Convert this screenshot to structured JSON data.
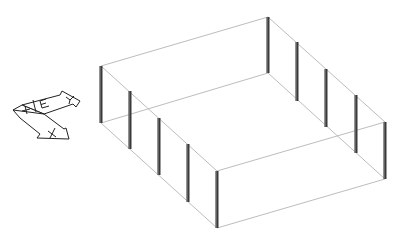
{
  "diagram": {
    "type": "isometric-wireframe",
    "colors": {
      "background": "#ffffff",
      "rails": "#bdbdbd",
      "posts": "#3a3a3a",
      "ucs_icon": "#222222"
    },
    "posts": [
      {
        "x": 101,
        "top": 66,
        "bottom": 123
      },
      {
        "x": 130,
        "top": 91,
        "bottom": 149
      },
      {
        "x": 159,
        "top": 118,
        "bottom": 175
      },
      {
        "x": 188,
        "top": 144,
        "bottom": 202
      },
      {
        "x": 217,
        "top": 171,
        "bottom": 228
      },
      {
        "x": 268,
        "top": 17,
        "bottom": 73
      },
      {
        "x": 297,
        "top": 42,
        "bottom": 101
      },
      {
        "x": 326,
        "top": 69,
        "bottom": 127
      },
      {
        "x": 356,
        "top": 95,
        "bottom": 153
      },
      {
        "x": 385,
        "top": 122,
        "bottom": 179
      }
    ],
    "ucs_icon": {
      "labels": {
        "x_axis": "X",
        "y_axis": "Y",
        "origin": "+",
        "edge": "E"
      }
    }
  }
}
